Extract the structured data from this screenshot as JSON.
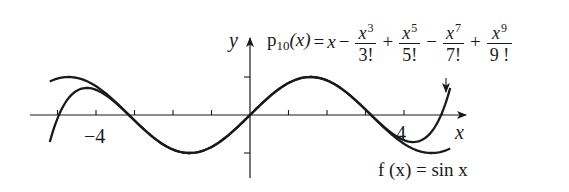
{
  "figure": {
    "y_axis_label": "y",
    "x_axis_label": "x",
    "tick_labels": {
      "neg4": "−4",
      "pos4": "4"
    },
    "polynomial_label": {
      "lhs_name": "p",
      "lhs_subscript": "10",
      "lhs_arg": "(x)",
      "equals": "=",
      "first_term": "x",
      "terms": [
        {
          "sign": "−",
          "numerator_base": "x",
          "exponent": "3",
          "denominator": "3!"
        },
        {
          "sign": "+",
          "numerator_base": "x",
          "exponent": "5",
          "denominator": "5!"
        },
        {
          "sign": "−",
          "numerator_base": "x",
          "exponent": "7",
          "denominator": "7!"
        },
        {
          "sign": "+",
          "numerator_base": "x",
          "exponent": "9",
          "denominator": "9 !"
        }
      ]
    },
    "function_label": "f (x) = sin x",
    "arrow_pointer": "down-arrow",
    "colors": {
      "ink": "#1a1a1a",
      "background": "#ffffff"
    }
  },
  "chart_data": {
    "type": "line",
    "title": "",
    "xlabel": "x",
    "ylabel": "y",
    "xlim": [
      -5.8,
      5.6
    ],
    "ylim": [
      -1.6,
      1.8
    ],
    "x_ticks": [
      -5,
      -4,
      -3,
      -2,
      -1,
      1,
      2,
      3,
      4,
      5
    ],
    "x_tick_labels": {
      "-4": "−4",
      "4": "4"
    },
    "y_ticks": [
      -1,
      1
    ],
    "grid": false,
    "legend": "none (curves labeled inline)",
    "series": [
      {
        "name": "f(x) = sin x",
        "function": "sin(x)",
        "x_range": [
          -5.2,
          5.2
        ]
      },
      {
        "name": "p10(x) = x - x^3/3! + x^5/5! - x^7/7! + x^9/9!",
        "function": "x - x^3/6 + x^5/120 - x^7/5040 + x^9/362880",
        "x_range": [
          -5.2,
          5.2
        ]
      }
    ],
    "annotations": [
      {
        "text": "p10(x) = x − x^3/3! + x^5/5! − x^7/7! + x^9/9!",
        "position": "top-right",
        "arrow_to": "right end of p10 curve"
      },
      {
        "text": "f(x) = sin x",
        "position": "bottom-right"
      }
    ]
  }
}
